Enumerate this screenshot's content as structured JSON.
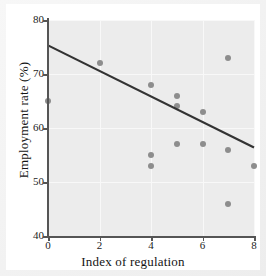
{
  "chart_data": {
    "type": "scatter",
    "title": "",
    "xlabel": "Index of regulation",
    "ylabel": "Employment rate (%)",
    "xlim": [
      0,
      8
    ],
    "ylim": [
      40,
      80
    ],
    "xticks": [
      0,
      2,
      4,
      6,
      8
    ],
    "yticks": [
      40,
      50,
      60,
      70,
      80
    ],
    "xtick_labels": [
      "0",
      "2",
      "4",
      "6",
      "8"
    ],
    "ytick_labels": [
      "40",
      "50",
      "60",
      "70",
      "80"
    ],
    "grid": true,
    "legend": "none",
    "point_color": "#8d8d8d",
    "line_color": "#333333",
    "plot_background": "#ececec",
    "points": [
      {
        "x": 0,
        "y": 65
      },
      {
        "x": 2,
        "y": 72
      },
      {
        "x": 4,
        "y": 68
      },
      {
        "x": 4,
        "y": 55
      },
      {
        "x": 4,
        "y": 53
      },
      {
        "x": 5,
        "y": 66
      },
      {
        "x": 5,
        "y": 64
      },
      {
        "x": 5,
        "y": 57
      },
      {
        "x": 6,
        "y": 63
      },
      {
        "x": 6,
        "y": 57
      },
      {
        "x": 7,
        "y": 73
      },
      {
        "x": 7,
        "y": 56
      },
      {
        "x": 7,
        "y": 46
      },
      {
        "x": 8,
        "y": 53
      }
    ],
    "trendline": {
      "type": "linear-fit",
      "x_start": 0,
      "y_start": 75.3,
      "x_end": 8,
      "y_end": 56.4
    }
  }
}
